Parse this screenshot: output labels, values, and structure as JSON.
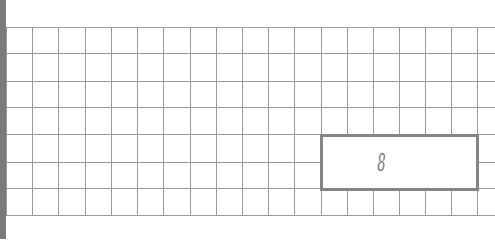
{
  "worksheet": {
    "grid": {
      "columns": 19,
      "rows": 7,
      "cell_size_px": 26.3,
      "line_color": "#9a9a9a"
    },
    "answer_box": {
      "value": "8",
      "border_color": "#858585"
    },
    "left_bar_color": "#7a7a7a"
  }
}
